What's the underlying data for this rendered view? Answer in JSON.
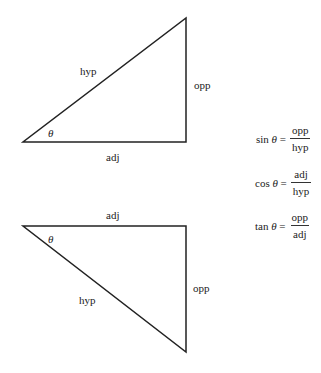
{
  "top_triangle": {
    "hyp": "hyp",
    "opp": "opp",
    "adj": "adj",
    "angle": "θ"
  },
  "bottom_triangle": {
    "hyp": "hyp",
    "opp": "opp",
    "adj": "adj",
    "angle": "θ"
  },
  "formulas": [
    {
      "fn": "sin",
      "angle": "θ",
      "eq": "=",
      "num": "opp",
      "den": "hyp"
    },
    {
      "fn": "cos",
      "angle": "θ",
      "eq": "=",
      "num": "adj",
      "den": "hyp"
    },
    {
      "fn": "tan",
      "angle": "θ",
      "eq": "=",
      "num": "opp",
      "den": "adj"
    }
  ]
}
